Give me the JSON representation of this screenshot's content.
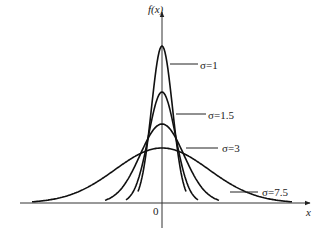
{
  "chart_data": {
    "type": "line",
    "title": "",
    "xlabel": "x",
    "ylabel": "f(x)",
    "origin_label": "0",
    "series": [
      {
        "name": "σ=1",
        "sigma": 1,
        "label": "σ=1"
      },
      {
        "name": "σ=1.5",
        "sigma": 1.5,
        "label": "σ=1.5"
      },
      {
        "name": "σ=3",
        "sigma": 3,
        "label": "σ=3"
      },
      {
        "name": "σ=7.5",
        "sigma": 7.5,
        "label": "σ=7.5"
      }
    ],
    "grid": false,
    "legend": "inline labels with leader lines on right"
  },
  "axes": {
    "y_label": "f(x)",
    "x_label": "x",
    "origin": "0"
  },
  "labels": {
    "s1": "σ=1",
    "s15": "σ=1.5",
    "s3": "σ=3",
    "s75": "σ=7.5"
  }
}
